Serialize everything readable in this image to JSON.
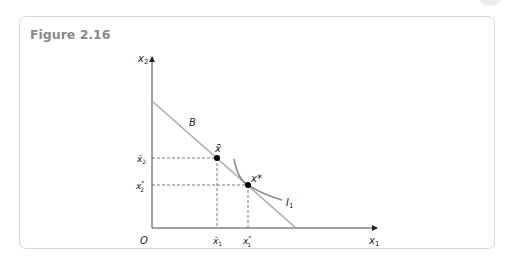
{
  "figure": {
    "title": "Figure 2.16"
  },
  "diagram": {
    "type": "consumer-choice-budget-line",
    "axes": {
      "origin": "O",
      "x_label": "x",
      "x_sub": "1",
      "y_label": "x",
      "y_sub": "2"
    },
    "budget_line": {
      "label": "B"
    },
    "indifference_curve": {
      "label": "I",
      "sub": "1"
    },
    "points": {
      "x_bar": {
        "label": "x̄",
        "x_tick": "x̄",
        "x_tick_sub": "1",
        "y_tick": "x̄",
        "y_tick_sub": "2"
      },
      "x_star": {
        "label": "x*",
        "x_tick": "x",
        "x_tick_sub": "1",
        "x_tick_sup": "*",
        "y_tick": "x",
        "y_tick_sub": "2",
        "y_tick_sup": "*"
      }
    },
    "colors": {
      "axis": "#333333",
      "budget": "#aaaaaa",
      "curve": "#888888",
      "dashed": "#555555",
      "point": "#000000"
    }
  }
}
